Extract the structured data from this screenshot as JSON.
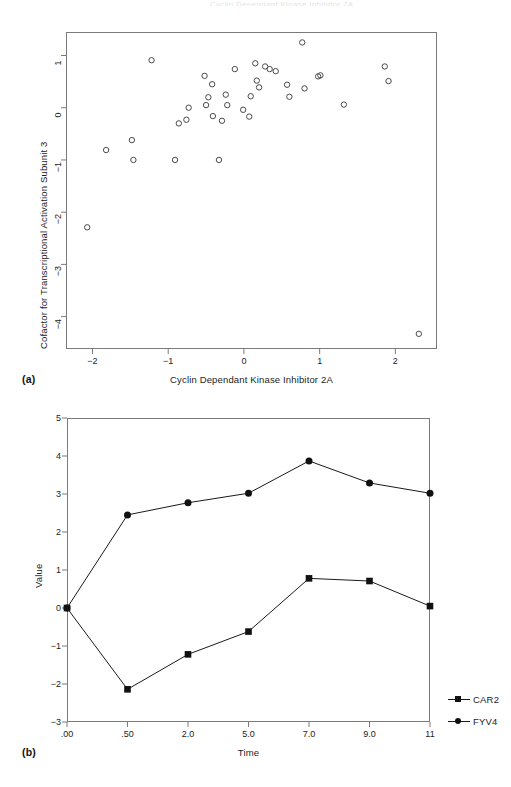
{
  "figure": {
    "top_clipped_text": "Cyclin Dependant Kinase Inhibitor 2A",
    "panel_a_tag": "(a)",
    "panel_b_tag": "(b)"
  },
  "chart_data": [
    {
      "type": "scatter",
      "panel": "(a)",
      "title": "",
      "xlabel": "Cyclin Dependant Kinase Inhibitor 2A",
      "ylabel": "Cofactor for Transcriptional Activation Subunit 3",
      "xlim": [
        -2.35,
        2.55
      ],
      "ylim": [
        -4.62,
        1.45
      ],
      "xticks": [
        -2,
        -1,
        0,
        1,
        2
      ],
      "xticklabels": [
        "−2",
        "−1",
        "0",
        "1",
        "2"
      ],
      "yticks": [
        1,
        0,
        -1,
        -2,
        -3,
        -4
      ],
      "yticklabels": [
        "1",
        "0",
        "−1",
        "−2",
        "−3",
        "−4"
      ],
      "grid": false,
      "marker": "open-circle",
      "points": [
        [
          -2.07,
          -2.29
        ],
        [
          -1.82,
          -0.81
        ],
        [
          -1.48,
          -0.62
        ],
        [
          -1.46,
          -1.0
        ],
        [
          -1.22,
          0.91
        ],
        [
          -0.91,
          -1.0
        ],
        [
          -0.86,
          -0.3
        ],
        [
          -0.76,
          -0.23
        ],
        [
          -0.73,
          0.0
        ],
        [
          -0.52,
          0.61
        ],
        [
          -0.5,
          0.05
        ],
        [
          -0.47,
          0.2
        ],
        [
          -0.42,
          0.45
        ],
        [
          -0.41,
          -0.16
        ],
        [
          -0.33,
          -1.0
        ],
        [
          -0.29,
          -0.25
        ],
        [
          -0.24,
          0.25
        ],
        [
          -0.22,
          0.05
        ],
        [
          -0.12,
          0.74
        ],
        [
          -0.01,
          -0.04
        ],
        [
          0.07,
          -0.17
        ],
        [
          0.09,
          0.22
        ],
        [
          0.15,
          0.85
        ],
        [
          0.17,
          0.52
        ],
        [
          0.2,
          0.39
        ],
        [
          0.28,
          0.79
        ],
        [
          0.34,
          0.74
        ],
        [
          0.42,
          0.7
        ],
        [
          0.57,
          0.44
        ],
        [
          0.6,
          0.21
        ],
        [
          0.77,
          1.25
        ],
        [
          0.8,
          0.37
        ],
        [
          0.98,
          0.6
        ],
        [
          1.01,
          0.62
        ],
        [
          1.32,
          0.06
        ],
        [
          1.86,
          0.79
        ],
        [
          1.91,
          0.51
        ],
        [
          2.31,
          -4.33
        ]
      ]
    },
    {
      "type": "line",
      "panel": "(b)",
      "title": "",
      "xlabel": "Time",
      "ylabel": "Value",
      "categories": [
        ".00",
        ".50",
        "2.0",
        "5.0",
        "7.0",
        "9.0",
        "11"
      ],
      "yticks": [
        5,
        4,
        3,
        2,
        1,
        0,
        -1,
        -2,
        -3
      ],
      "yticklabels": [
        "5",
        "4",
        "3",
        "2",
        "1",
        "0",
        "−1",
        "−2",
        "−3"
      ],
      "ylim": [
        -3,
        5
      ],
      "grid": false,
      "legend_position": "right",
      "series": [
        {
          "name": "CAR2",
          "marker": "square",
          "values": [
            0.0,
            -2.14,
            -1.22,
            -0.62,
            0.78,
            0.71,
            0.05
          ]
        },
        {
          "name": "FYV4",
          "marker": "circle",
          "values": [
            0.0,
            2.45,
            2.77,
            3.02,
            3.87,
            3.29,
            3.02
          ]
        }
      ]
    }
  ],
  "legend": {
    "entries": [
      {
        "label": "CAR2",
        "marker": "square"
      },
      {
        "label": "FYV4",
        "marker": "circle"
      }
    ]
  }
}
